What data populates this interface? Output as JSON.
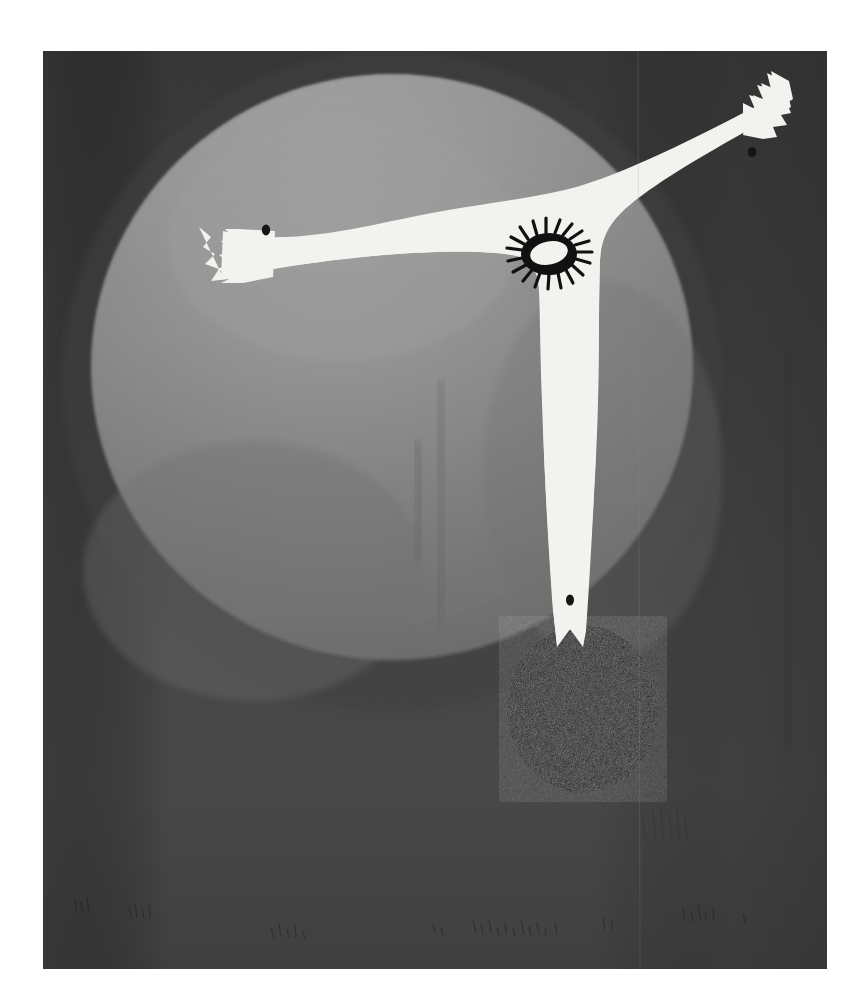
{
  "artwork": {
    "medium_appearance": "painting on canvas",
    "canvas": {
      "x": 43,
      "y": 51,
      "width": 784,
      "height": 918,
      "background_color": "#3b3b3b",
      "border_visible": false
    },
    "page_background_color": "#ffffff",
    "palette": {
      "white_figure": "#f2f2ee",
      "light_grey_disc_top": "#919191",
      "mid_grey_disc": "#828282",
      "low_grey_disc": "#757575",
      "dark_ground": "#3b3b3b",
      "dark_ground_lower": "#434343",
      "black_circle": "#181818",
      "eye_black": "#101010",
      "dot_black": "#141414"
    },
    "elements": [
      {
        "name": "large-grey-disc",
        "shape": "ellipse",
        "cx": 392,
        "cy": 367,
        "rx": 300,
        "ry": 292,
        "fill": "#848484",
        "description": "Large soft-edged grey sphere occupying the upper two thirds of the canvas"
      },
      {
        "name": "white-figure",
        "shape": "t-shaped anthropomorph",
        "fill": "#f2f2ee",
        "description": "Flat white T / cruciform creature with two outstretched jagged-ended arms and one tapering leg"
      },
      {
        "name": "left-arm",
        "tip_x": 197,
        "tip_y": 233,
        "fingers": 4,
        "description": "Left arm extends horizontally left, tip ends in jagged finger notches"
      },
      {
        "name": "right-arm",
        "tip_x": 742,
        "tip_y": 144,
        "fingers": 4,
        "description": "Right arm rises diagonally upward to the right, tip ends in jagged finger notches"
      },
      {
        "name": "central-leg",
        "bottom_y": 630,
        "description": "Single broad vertical leg tapering downward, ending in a V notch"
      },
      {
        "name": "eye",
        "cx": 528,
        "cy": 239,
        "rx": 16,
        "ry": 10,
        "lashes": 18,
        "fill_inner": "#f2f2ee",
        "fill_outer": "#101010",
        "description": "Single spiky sun-like eye on the figure's right shoulder"
      },
      {
        "name": "left-hand-dot",
        "cx": 265,
        "cy": 230,
        "r": 4
      },
      {
        "name": "right-hand-dot",
        "cx": 750,
        "cy": 152,
        "r": 4
      },
      {
        "name": "foot-dot",
        "cx": 527,
        "cy": 600,
        "r": 4
      },
      {
        "name": "black-circle",
        "shape": "ellipse",
        "cx": 583,
        "cy": 709,
        "rx": 75,
        "ry": 83,
        "fill": "#181818",
        "description": "Dark textured circle overlapping the lower right of the grey disc"
      },
      {
        "name": "canvas-seam-line",
        "x": 638,
        "description": "Faint vertical seam running the full height of the canvas"
      }
    ],
    "texture_notes": {
      "brushwork": "visible vertical brush striations throughout",
      "bottom_edge_marks": "faint dark scratchy strokes along the lower margin",
      "disc_center_smudge": "darker vertical smudge near the centre of the grey disc"
    }
  }
}
